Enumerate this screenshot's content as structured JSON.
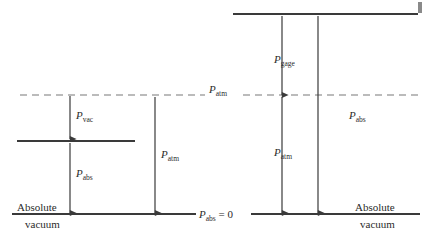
{
  "figure": {
    "background_color": "#ffffff",
    "line_color": "#3a3a3a",
    "dashed_line_color": "#6f6f6f",
    "text_color": "#2b2b2b"
  },
  "labels": {
    "p_vac": {
      "symbol": "P",
      "subscript": "vac"
    },
    "p_abs_left": {
      "symbol": "P",
      "subscript": "abs"
    },
    "p_atm_left": {
      "symbol": "P",
      "subscript": "atm"
    },
    "p_atm_line": {
      "symbol": "P",
      "subscript": "atm"
    },
    "p_gage": {
      "symbol": "P",
      "subscript": "gage"
    },
    "p_atm_right": {
      "symbol": "P",
      "subscript": "atm"
    },
    "p_abs_right": {
      "symbol": "P",
      "subscript": "abs"
    },
    "p_abs_zero": {
      "symbol": "P",
      "subscript": "abs",
      "suffix": " = 0"
    },
    "absolute_left": "Absolute",
    "vacuum_left": "vacuum",
    "absolute_right": "Absolute",
    "vacuum_right": "vacuum"
  },
  "lines": {
    "top_pressure_line": {
      "name": "top-pressure-line",
      "y": 14,
      "x1": 233,
      "x2": 418,
      "style": "solid"
    },
    "atmospheric_line": {
      "name": "atmospheric-pressure-line",
      "y": 95,
      "x1": 20,
      "x2": 420,
      "style": "dashed"
    },
    "vacuum_state_line": {
      "name": "vacuum-state-line",
      "y": 141,
      "x1": 17,
      "x2": 135,
      "style": "solid"
    },
    "absolute_zero_line": {
      "name": "absolute-zero-line",
      "y": 214,
      "x1": 12,
      "x2": 420,
      "style": "solid"
    }
  },
  "arrows": [
    {
      "name": "p-vac-arrow",
      "x": 70,
      "from_y": 95,
      "to_y": 141,
      "direction": "down"
    },
    {
      "name": "p-abs-left-arrow",
      "x": 70,
      "from_y": 214,
      "to_y": 141,
      "direction": "up"
    },
    {
      "name": "p-atm-left-arrow",
      "x": 155,
      "from_y": 214,
      "to_y": 95,
      "direction": "up"
    },
    {
      "name": "p-gage-arrow",
      "x": 282,
      "from_y": 95,
      "to_y": 14,
      "direction": "up"
    },
    {
      "name": "p-atm-right-arrow",
      "x": 282,
      "from_y": 214,
      "to_y": 95,
      "direction": "up"
    },
    {
      "name": "p-abs-right-arrow",
      "x": 318,
      "from_y": 214,
      "to_y": 14,
      "direction": "up"
    }
  ]
}
